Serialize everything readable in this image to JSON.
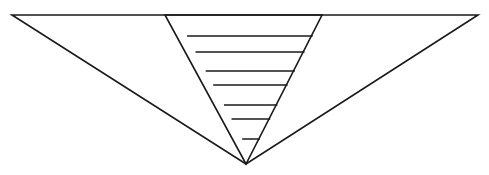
{
  "figure": {
    "title": "",
    "canvas": {
      "width": 489,
      "height": 175,
      "background": "#ffffff"
    },
    "style": {
      "stroke_color": "#1a1a1a",
      "stroke_width_outer": 1.6,
      "stroke_width_inner": 1.6,
      "stroke_width_hatch": 1.5,
      "fill": "none"
    },
    "shapes": [
      {
        "name": "outer-inverted-triangle",
        "kind": "polygon",
        "points": "12,15 478,15 246,164"
      },
      {
        "name": "inner-inverted-triangle",
        "kind": "polygon",
        "points": "165,15 322,15 246,164"
      }
    ],
    "top_edge": {
      "name": "top-baseline",
      "x1": 12,
      "y1": 15,
      "x2": 478,
      "y2": 15
    },
    "apex": {
      "x": 246,
      "y": 164
    },
    "inner_top_left": {
      "x": 165,
      "y": 15
    },
    "inner_top_right": {
      "x": 322,
      "y": 15
    },
    "hatch_lines": [
      {
        "index": 1,
        "y": 36,
        "x1": 187.0,
        "x2": 312.7
      },
      {
        "index": 2,
        "y": 52,
        "x1": 195.5,
        "x2": 304.5
      },
      {
        "index": 3,
        "y": 71,
        "x1": 205.7,
        "x2": 294.8
      },
      {
        "index": 4,
        "y": 85,
        "x1": 213.2,
        "x2": 287.6
      },
      {
        "index": 5,
        "y": 105,
        "x1": 224.0,
        "x2": 277.4
      },
      {
        "index": 6,
        "y": 119,
        "x1": 231.5,
        "x2": 270.2
      },
      {
        "index": 7,
        "y": 139,
        "x1": 242.2,
        "x2": 259.9
      }
    ],
    "hatch_count": 7
  }
}
